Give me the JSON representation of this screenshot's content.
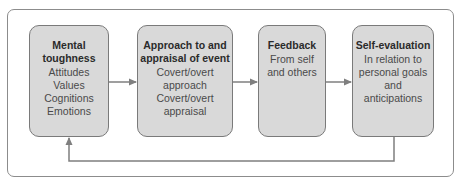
{
  "diagram": {
    "type": "flow-cycle",
    "nodes": [
      {
        "id": "mental",
        "title_lines": [
          "Mental",
          "toughness"
        ],
        "body_lines": [
          "Attitudes",
          "Values",
          "Cognitions",
          "Emotions"
        ]
      },
      {
        "id": "approach",
        "title_lines": [
          "Approach to and",
          "appraisal of event"
        ],
        "body_lines": [
          "Covert/overt",
          "approach",
          "Covert/overt",
          "appraisal"
        ]
      },
      {
        "id": "feedback",
        "title_lines": [
          "Feedback"
        ],
        "body_lines": [
          "From self",
          "and others"
        ]
      },
      {
        "id": "selfeval",
        "title_lines": [
          "Self-evaluation"
        ],
        "body_lines": [
          "In relation to",
          "personal goals",
          "and",
          "anticipations"
        ]
      }
    ],
    "edges": [
      {
        "from": "mental",
        "to": "approach"
      },
      {
        "from": "approach",
        "to": "feedback"
      },
      {
        "from": "feedback",
        "to": "selfeval"
      },
      {
        "from": "selfeval",
        "to": "mental",
        "route": "loop-below"
      }
    ],
    "colors": {
      "box_fill": "#d9d9d9",
      "box_border": "#7a7a7a",
      "arrow": "#7f7f7f",
      "frame": "#8c8c8c"
    }
  }
}
